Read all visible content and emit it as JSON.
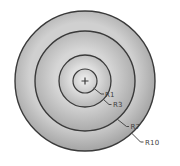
{
  "figure": {
    "type": "concentric-circles",
    "background": "#ffffff",
    "stroke_color": "#3a3a3a",
    "leader_color": "#4a4a4a",
    "label_color": "#3f3f3f",
    "label_font_px": 7,
    "center": {
      "x": 85,
      "y": 81,
      "marker": "+",
      "marker_size": 7
    },
    "circles": [
      {
        "label": "R10",
        "radius_value": 10,
        "radius_px": 70,
        "stroke_width": 1.4,
        "gradient": [
          [
            "70%",
            "#d0d0d0"
          ],
          [
            "100%",
            "#a4a4a4"
          ]
        ],
        "leader": [
          [
            131.5,
            133
          ],
          [
            140.5,
            142
          ],
          [
            143.5,
            142
          ]
        ],
        "label_pos": [
          145,
          144.5
        ]
      },
      {
        "label": "R7",
        "radius_value": 7,
        "radius_px": 50,
        "stroke_width": 1.4,
        "gradient": [
          [
            "51%",
            "#d6d6d6"
          ],
          [
            "100%",
            "#ababab"
          ]
        ],
        "leader": [
          [
            117,
            119
          ],
          [
            126.5,
            126.5
          ],
          [
            129,
            126.5
          ]
        ],
        "label_pos": [
          130.5,
          129
        ]
      },
      {
        "label": "R3",
        "radius_value": 3,
        "radius_px": 26,
        "stroke_width": 1.3,
        "gradient": [
          [
            "45%",
            "#e0e0e0"
          ],
          [
            "100%",
            "#b6b6b6"
          ]
        ],
        "leader": [
          [
            103,
            99
          ],
          [
            109,
            104.5
          ],
          [
            111.5,
            104.5
          ]
        ],
        "label_pos": [
          113,
          107
        ]
      },
      {
        "label": "R1",
        "radius_value": 1,
        "radius_px": 12,
        "stroke_width": 1.2,
        "gradient": [
          [
            "0%",
            "#f1f1f1"
          ],
          [
            "100%",
            "#c9c9c9"
          ]
        ],
        "leader": [
          [
            93.5,
            88
          ],
          [
            101,
            94
          ],
          [
            104,
            94
          ]
        ],
        "label_pos": [
          105,
          96.5
        ]
      }
    ]
  }
}
